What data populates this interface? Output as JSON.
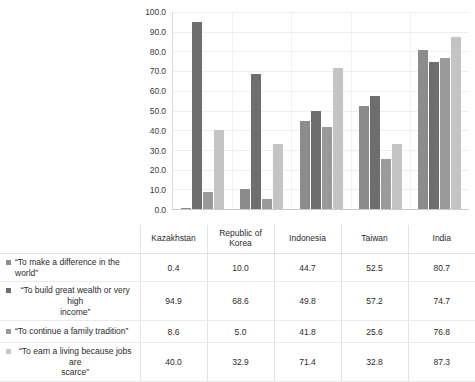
{
  "artifact": {
    "text": "·            ·              ·"
  },
  "chart_data": {
    "type": "bar",
    "title": "",
    "subtitle": "",
    "xlabel": "",
    "ylabel": "",
    "ylim": [
      0,
      100
    ],
    "ytick_step": 10,
    "ytick_labels": [
      "100.0",
      "90.0",
      "80.0",
      "70.0",
      "60.0",
      "50.0",
      "40.0",
      "30.0",
      "20.0",
      "10.0",
      "0.0"
    ],
    "grid": true,
    "legend_position": "table-left-column",
    "categories": [
      "Kazakhstan",
      "Republic of Korea",
      "Indonesia",
      "Taiwan",
      "India"
    ],
    "series": [
      {
        "name": "“To make a difference in the world”",
        "color": "#8c8c8c",
        "values": [
          0.4,
          10.0,
          44.7,
          52.5,
          80.7
        ],
        "labels": [
          "0.4",
          "10.0",
          "44.7",
          "52.5",
          "80.7"
        ]
      },
      {
        "name": "“To build great wealth or very high income”",
        "color": "#6e6e6e",
        "values": [
          94.9,
          68.6,
          49.8,
          57.2,
          74.7
        ],
        "labels": [
          "94.9",
          "68.6",
          "49.8",
          "57.2",
          "74.7"
        ],
        "wrapped": true,
        "line1": "“To build great wealth or very high",
        "line2": "income”"
      },
      {
        "name": "“To continue a family tradition”",
        "color": "#9a9a9a",
        "values": [
          8.6,
          5.0,
          41.8,
          25.6,
          76.8
        ],
        "labels": [
          "8.6",
          "5.0",
          "41.8",
          "25.6",
          "76.8"
        ]
      },
      {
        "name": "“To earn a living because jobs are scarce”",
        "color": "#c4c4c4",
        "values": [
          40.0,
          32.9,
          71.4,
          32.8,
          87.3
        ],
        "labels": [
          "40.0",
          "32.9",
          "71.4",
          "32.8",
          "87.3"
        ],
        "wrapped": true,
        "line1": "“To earn a living because jobs are",
        "line2": "scarce”"
      }
    ]
  },
  "table": {
    "corner_label": "",
    "column_headers": [
      "Kazakhstan",
      "Republic of Korea",
      "Indonesia",
      "Taiwan",
      "India"
    ],
    "header_lines": [
      [
        "Kazakhstan"
      ],
      [
        "Republic of",
        "Korea"
      ],
      [
        "Indonesia"
      ],
      [
        "Taiwan"
      ],
      [
        "India"
      ]
    ]
  }
}
